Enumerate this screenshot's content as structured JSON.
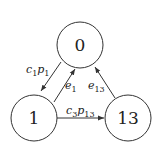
{
  "diagram": {
    "type": "state-transition-graph",
    "nodes": [
      {
        "id": "0",
        "label": "0",
        "cx": 80,
        "cy": 45,
        "r": 23
      },
      {
        "id": "1",
        "label": "1",
        "cx": 34,
        "cy": 118,
        "r": 23
      },
      {
        "id": "13",
        "label": "13",
        "cx": 128,
        "cy": 118,
        "r": 23
      }
    ],
    "edges": [
      {
        "from": "0",
        "to": "1",
        "label_main": "c",
        "label_sub1": "1",
        "label_main2": "p",
        "label_sub2": "1"
      },
      {
        "from": "1",
        "to": "0",
        "label_main": "e",
        "label_sub1": "1"
      },
      {
        "from": "13",
        "to": "0",
        "label_main": "e",
        "label_sub1": "13"
      },
      {
        "from": "1",
        "to": "13",
        "label_main": "c",
        "label_sub1": "3",
        "label_main2": "p",
        "label_sub2": "13"
      }
    ],
    "colors": {
      "stroke": "#333333",
      "text": "#222222",
      "background": "#ffffff"
    }
  }
}
